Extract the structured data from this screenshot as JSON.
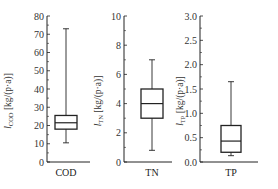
{
  "chart_data": [
    {
      "type": "box",
      "category": "COD",
      "ylabel": "l_COD [kg/(p·a)]",
      "ylabel_main": "l",
      "ylabel_sub": "COD",
      "ylabel_unit": "[kg/(p·a)]",
      "ylim": [
        0,
        80
      ],
      "yticks": [
        0,
        10,
        20,
        30,
        40,
        50,
        60,
        70,
        80
      ],
      "ytick_labels": [
        "0",
        "10",
        "20",
        "30",
        "40",
        "50",
        "60",
        "70",
        "80"
      ],
      "stats": {
        "whisker_low": 10.5,
        "q1": 18,
        "median": 21.5,
        "q3": 25.5,
        "whisker_high": 73
      }
    },
    {
      "type": "box",
      "category": "TN",
      "ylabel": "l_TN [kg/(p·a)]",
      "ylabel_main": "l",
      "ylabel_sub": "TN",
      "ylabel_unit": "[kg/(p·a)]",
      "ylim": [
        0,
        10
      ],
      "yticks": [
        0,
        2,
        4,
        6,
        8,
        10
      ],
      "ytick_labels": [
        "0",
        "2",
        "4",
        "6",
        "8",
        "10"
      ],
      "stats": {
        "whisker_low": 0.8,
        "q1": 3.0,
        "median": 4.0,
        "q3": 5.0,
        "whisker_high": 7.0
      }
    },
    {
      "type": "box",
      "category": "TP",
      "ylabel": "l_TP [kg/(p·a)]",
      "ylabel_main": "l",
      "ylabel_sub": "TP",
      "ylabel_unit": "[kg/(p·a)]",
      "ylim": [
        0,
        3.0
      ],
      "yticks": [
        0,
        0.5,
        1.0,
        1.5,
        2.0,
        2.5,
        3.0
      ],
      "ytick_labels": [
        "0.0",
        "0.5",
        "1.0",
        "1.5",
        "2.0",
        "2.5",
        "3.0"
      ],
      "stats": {
        "whisker_low": 0.13,
        "q1": 0.2,
        "median": 0.43,
        "q3": 0.75,
        "whisker_high": 1.65
      }
    }
  ],
  "layout": {
    "panels": [
      {
        "axis_x": 47,
        "box_cx": 66,
        "box_w": 22,
        "ylabel_x": 11,
        "xaxis_end": 90
      },
      {
        "axis_x": 124,
        "box_cx": 152,
        "box_w": 22,
        "ylabel_x": 101,
        "xaxis_end": 172
      },
      {
        "axis_x": 200,
        "box_cx": 231,
        "box_w": 20,
        "ylabel_x": 183,
        "xaxis_end": 258
      }
    ],
    "y_top": 16,
    "y_bottom": 162,
    "stroke": "#222222"
  }
}
